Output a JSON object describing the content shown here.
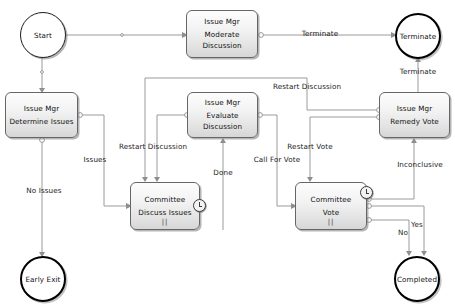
{
  "diagram": {
    "type": "bpmn-flowchart",
    "colors": {
      "node_fill": "#eeeeee",
      "node_border": "#666666",
      "event_border": "#000000",
      "edge_stroke": "#9a9a9a",
      "text": "#111111",
      "background": "#ffffff"
    }
  },
  "nodes": [
    {
      "id": "start",
      "kind": "start-event",
      "label": "Start",
      "x": 20,
      "y": 12,
      "w": 46,
      "h": 46
    },
    {
      "id": "moderate-discussion",
      "kind": "task",
      "lane": "Issue Mgr",
      "label_line1": "Moderate",
      "label_line2": "Discussion",
      "x": 186,
      "y": 10,
      "w": 72,
      "h": 48
    },
    {
      "id": "terminate",
      "kind": "end-event",
      "label": "Terminate",
      "x": 395,
      "y": 13,
      "w": 46,
      "h": 46
    },
    {
      "id": "determine-issues",
      "kind": "task",
      "lane": "Issue Mgr",
      "label_line1": "Determine Issues",
      "label_line2": "",
      "x": 5,
      "y": 92,
      "w": 73,
      "h": 46
    },
    {
      "id": "evaluate-discussion",
      "kind": "task",
      "lane": "Issue Mgr",
      "label_line1": "Evaluate",
      "label_line2": "Discussion",
      "x": 187,
      "y": 92,
      "w": 71,
      "h": 46
    },
    {
      "id": "remedy-vote",
      "kind": "task",
      "lane": "Issue Mgr",
      "label_line1": "Remedy Vote",
      "label_line2": "",
      "x": 379,
      "y": 92,
      "w": 71,
      "h": 46
    },
    {
      "id": "discuss-issues",
      "kind": "subprocess",
      "lane": "Committee",
      "label_line1": "Discuss Issues",
      "label_line2": "",
      "marker": "||",
      "boundary_event": "timer-icon",
      "x": 130,
      "y": 182,
      "w": 70,
      "h": 48
    },
    {
      "id": "committee-vote",
      "kind": "subprocess",
      "lane": "Committee",
      "label_line1": "Vote",
      "label_line2": "",
      "marker": "||",
      "boundary_event": "timer-icon",
      "x": 295,
      "y": 182,
      "w": 72,
      "h": 48
    },
    {
      "id": "early-exit",
      "kind": "end-event",
      "label": "Early Exit",
      "x": 20,
      "y": 256,
      "w": 46,
      "h": 46
    },
    {
      "id": "completed",
      "kind": "end-event",
      "label": "Completed",
      "x": 394,
      "y": 256,
      "w": 46,
      "h": 46
    }
  ],
  "edge_labels": [
    {
      "id": "lbl-terminate-top",
      "text": "Terminate",
      "x": 320,
      "y": 33
    },
    {
      "id": "lbl-terminate-up",
      "text": "Terminate",
      "x": 418,
      "y": 71
    },
    {
      "id": "lbl-restart-disc-top",
      "text": "Restart Discussion",
      "x": 307,
      "y": 86
    },
    {
      "id": "lbl-restart-disc",
      "text": "Restart Discussion",
      "x": 153,
      "y": 146
    },
    {
      "id": "lbl-restart-vote",
      "text": "Restart Vote",
      "x": 310,
      "y": 146
    },
    {
      "id": "lbl-issues",
      "text": "Issues",
      "x": 95,
      "y": 159
    },
    {
      "id": "lbl-call-for-vote",
      "text": "Call For Vote",
      "x": 277,
      "y": 159
    },
    {
      "id": "lbl-inconclusive",
      "text": "Inconclusive",
      "x": 420,
      "y": 164
    },
    {
      "id": "lbl-done",
      "text": "Done",
      "x": 223,
      "y": 172
    },
    {
      "id": "lbl-no-issues",
      "text": "No Issues",
      "x": 44,
      "y": 190
    },
    {
      "id": "lbl-yes",
      "text": "Yes",
      "x": 417,
      "y": 224
    },
    {
      "id": "lbl-no",
      "text": "No",
      "x": 403,
      "y": 232
    }
  ],
  "edges": [
    {
      "id": "e-start-moderate",
      "from": "start",
      "to": "moderate-discussion"
    },
    {
      "id": "e-start-determine",
      "from": "start",
      "to": "determine-issues"
    },
    {
      "id": "e-moderate-terminate",
      "from": "moderate-discussion",
      "to": "terminate",
      "label": "Terminate"
    },
    {
      "id": "e-remedy-terminate",
      "from": "remedy-vote",
      "to": "terminate",
      "label": "Terminate"
    },
    {
      "id": "e-determine-discuss",
      "from": "determine-issues",
      "to": "discuss-issues",
      "label": "Issues"
    },
    {
      "id": "e-determine-earlyexit",
      "from": "determine-issues",
      "to": "early-exit",
      "label": "No Issues"
    },
    {
      "id": "e-remedy-discuss",
      "from": "remedy-vote",
      "to": "discuss-issues",
      "label": "Restart Discussion"
    },
    {
      "id": "e-evaluate-discuss",
      "from": "evaluate-discussion",
      "to": "discuss-issues",
      "label": "Restart Discussion"
    },
    {
      "id": "e-discuss-evaluate",
      "from": "discuss-issues",
      "to": "evaluate-discussion",
      "label": "Done"
    },
    {
      "id": "e-evaluate-vote",
      "from": "evaluate-discussion",
      "to": "committee-vote",
      "label": "Call For Vote"
    },
    {
      "id": "e-remedy-vote-restart",
      "from": "remedy-vote",
      "to": "committee-vote",
      "label": "Restart Vote"
    },
    {
      "id": "e-vote-remedy",
      "from": "committee-vote",
      "to": "remedy-vote",
      "label": "Inconclusive"
    },
    {
      "id": "e-vote-completed-yes",
      "from": "committee-vote",
      "to": "completed",
      "label": "Yes"
    },
    {
      "id": "e-vote-completed-no",
      "from": "committee-vote",
      "to": "completed",
      "label": "No"
    }
  ]
}
